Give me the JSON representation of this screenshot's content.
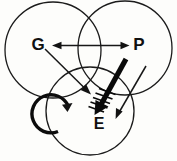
{
  "figure": {
    "type": "venn-arrow-diagram",
    "width": 177,
    "height": 161,
    "background_color": "#fdfdfb",
    "stroke_color": "#171717"
  },
  "circles": [
    {
      "id": "g",
      "label": "G",
      "cx": 53,
      "cy": 50,
      "r": 48,
      "label_x": 38,
      "label_y": 46
    },
    {
      "id": "p",
      "label": "P",
      "cx": 125,
      "cy": 48,
      "r": 47,
      "label_x": 139,
      "label_y": 46
    },
    {
      "id": "e",
      "label": "E",
      "cx": 90,
      "cy": 111,
      "r": 44,
      "label_x": 99,
      "label_y": 125
    }
  ],
  "labels": {
    "g": "G",
    "p": "P",
    "e": "E"
  },
  "arrows": [
    {
      "id": "g-p-bidirectional",
      "style": "thin",
      "heads": "both",
      "from": {
        "x": 53,
        "y": 45
      },
      "to": {
        "x": 128,
        "y": 45
      }
    },
    {
      "id": "g-to-e",
      "style": "thin",
      "heads": "end",
      "from": {
        "x": 46,
        "y": 50
      },
      "to": {
        "x": 90,
        "y": 93
      }
    },
    {
      "id": "p-to-e",
      "style": "thin",
      "heads": "end",
      "from": {
        "x": 146,
        "y": 67
      },
      "to": {
        "x": 116,
        "y": 118
      }
    },
    {
      "id": "thick-barbed-to-e",
      "style": "thick-barbed",
      "heads": "end",
      "from": {
        "x": 126,
        "y": 59
      },
      "to": {
        "x": 96,
        "y": 113
      },
      "hatch_count": 5
    },
    {
      "id": "e-self-loop",
      "style": "loop",
      "direction": "counterclockwise",
      "cx": 74,
      "cy": 123,
      "r": 19
    }
  ]
}
